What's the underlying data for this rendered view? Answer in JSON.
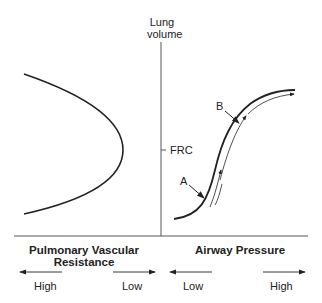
{
  "axis": {
    "y_label_line1": "Lung",
    "y_label_line2": "volume",
    "frc_label": "FRC"
  },
  "left_panel": {
    "title_line1": "Pulmonary Vascular",
    "title_line2": "Resistance",
    "arrow_left_label": "High",
    "arrow_right_label": "Low"
  },
  "right_panel": {
    "title": "Airway Pressure",
    "arrow_left_label": "Low",
    "arrow_right_label": "High"
  },
  "annotations": {
    "point_a": "A",
    "point_b": "B"
  },
  "colors": {
    "line": "#222222",
    "axis": "#555555"
  }
}
